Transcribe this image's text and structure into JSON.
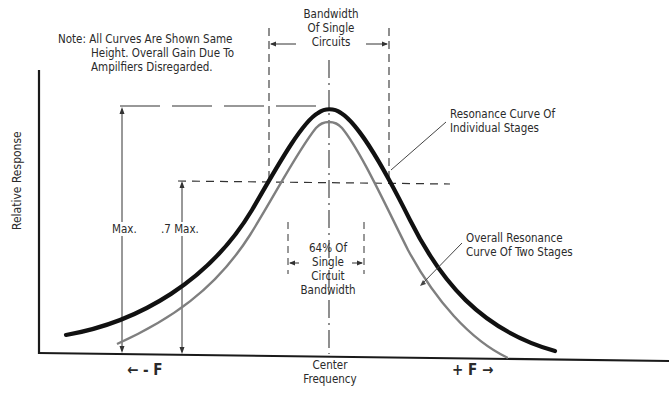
{
  "diagram": {
    "note": {
      "line1": "Note: All Curves Are Shown Same",
      "line2": "Height.  Overall Gain Due To",
      "line3": "Ampilfiers Disregarded."
    },
    "bandwidth_single": {
      "line1": "Bandwidth",
      "line2": "Of Single",
      "line3": "Circuits"
    },
    "resonance_individual": {
      "line1": "Resonance Curve Of",
      "line2": "Individual Stages"
    },
    "overall_resonance": {
      "line1": "Overall Resonance",
      "line2": "Curve Of Two Stages"
    },
    "bandwidth_64": {
      "line1": "64% Of",
      "line2": "Single",
      "line3": "Circuit",
      "line4": "Bandwidth"
    },
    "max_label": "Max.",
    "max07_label": ".7 Max.",
    "y_axis_label": "Relative Response",
    "x_axis": {
      "minus_f": "← - F",
      "plus_f": "+ F →",
      "center_line1": "Center",
      "center_line2": "Frequency"
    },
    "curves": [
      {
        "name": "Resonance Curve Of Individual Stages",
        "style": "thick",
        "color": "#111111"
      },
      {
        "name": "Overall Resonance Curve Of Two Stages",
        "style": "thin",
        "color": "#808080"
      }
    ]
  }
}
